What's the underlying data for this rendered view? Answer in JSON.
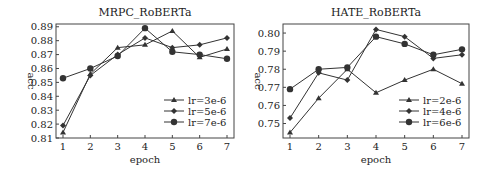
{
  "chart_data": [
    {
      "type": "line",
      "title": "MRPC_RoBERTa",
      "xlabel": "epoch",
      "ylabel": "acc",
      "x": [
        1,
        2,
        3,
        4,
        5,
        6,
        7
      ],
      "xticks": [
        "1",
        "2",
        "3",
        "4",
        "5",
        "6",
        "7"
      ],
      "yticks": [
        "0.81",
        "0.82",
        "0.83",
        "0.84",
        "0.85",
        "0.86",
        "0.87",
        "0.88",
        "0.89"
      ],
      "ylim": [
        0.81,
        0.892
      ],
      "grid": false,
      "legend_position": "lower right",
      "series": [
        {
          "name": "lr=3e-6",
          "marker": "triangle",
          "values": [
            0.814,
            0.856,
            0.875,
            0.877,
            0.887,
            0.868,
            0.874
          ]
        },
        {
          "name": "lr=5e-6",
          "marker": "diamond",
          "values": [
            0.819,
            0.855,
            0.87,
            0.882,
            0.875,
            0.877,
            0.882
          ]
        },
        {
          "name": "lr=7e-6",
          "marker": "circle",
          "values": [
            0.853,
            0.86,
            0.869,
            0.889,
            0.872,
            0.87,
            0.867
          ]
        }
      ]
    },
    {
      "type": "line",
      "title": "HATE_RoBERTa",
      "xlabel": "epoch",
      "ylabel": "acc",
      "x": [
        1,
        2,
        3,
        4,
        5,
        6,
        7
      ],
      "xticks": [
        "1",
        "2",
        "3",
        "4",
        "5",
        "6",
        "7"
      ],
      "yticks": [
        "0.75",
        "0.76",
        "0.77",
        "0.78",
        "0.79",
        "0.80"
      ],
      "ylim": [
        0.742,
        0.805
      ],
      "grid": false,
      "legend_position": "lower right",
      "series": [
        {
          "name": "lr=2e-6",
          "marker": "triangle",
          "values": [
            0.745,
            0.764,
            0.78,
            0.767,
            0.774,
            0.78,
            0.772
          ]
        },
        {
          "name": "lr=4e-6",
          "marker": "diamond",
          "values": [
            0.753,
            0.778,
            0.774,
            0.802,
            0.798,
            0.786,
            0.788
          ]
        },
        {
          "name": "lr=6e-6",
          "marker": "circle",
          "values": [
            0.769,
            0.78,
            0.781,
            0.798,
            0.794,
            0.788,
            0.791
          ]
        }
      ]
    }
  ],
  "colors": {
    "line": "#333333",
    "axis": "#444444",
    "background": "#ffffff"
  }
}
